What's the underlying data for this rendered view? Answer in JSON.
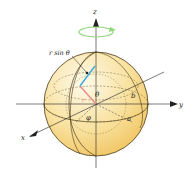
{
  "diagram": {
    "labels": {
      "z_axis": "z",
      "y_axis": "y",
      "x_axis": "x",
      "r_sin_theta": "r sin θ",
      "theta": "θ",
      "r": "r",
      "phi": "φ",
      "a": "a",
      "b": "b"
    },
    "colors": {
      "sphere_light": "#fdf3d2",
      "sphere_dark": "#f2c85e",
      "outline": "#4a3a1a",
      "rotation_arrow": "#8fd67a",
      "radius_segment": "#e8868a",
      "r_sin_theta_segment": "#3fa9d8",
      "axes": "#222222"
    }
  }
}
